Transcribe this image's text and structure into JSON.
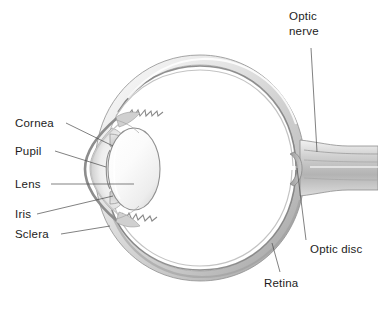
{
  "figure": {
    "background_color": "#ffffff",
    "text_color": "#1c1c1c",
    "leader_line_color": "#4a4a4a"
  },
  "labels": {
    "cornea": "Cornea",
    "pupil": "Pupil",
    "lens": "Lens",
    "iris": "Iris",
    "sclera": "Sclera",
    "optic_nerve_line1": "Optic",
    "optic_nerve_line2": "nerve",
    "optic_disc": "Optic disc",
    "retina": "Retina"
  },
  "structures": [
    {
      "name": "sclera",
      "description": "outer white fibrous coat of the eyeball"
    },
    {
      "name": "choroid-retina",
      "description": "dark inner lining layers of the globe wall"
    },
    {
      "name": "cornea",
      "description": "transparent bulging front dome"
    },
    {
      "name": "anterior-chamber",
      "description": "shaded space between cornea and lens"
    },
    {
      "name": "lens",
      "description": "central biconvex ellipse"
    },
    {
      "name": "iris",
      "description": "wedges above and below the lens"
    },
    {
      "name": "pupil",
      "description": "central aperture of the iris"
    },
    {
      "name": "ciliary-body",
      "description": "jagged ora serrata band inside the wall"
    },
    {
      "name": "vitreous-body",
      "description": "large white interior chamber"
    },
    {
      "name": "optic-disc",
      "description": "junction where nerve fibres leave the retina"
    },
    {
      "name": "optic-nerve",
      "description": "tapered trunk leaving the globe to the right"
    }
  ],
  "colors": {
    "sclera_light": "#f4f4f4",
    "sclera_mid": "#d9d9d9",
    "sclera_shadow": "#a8a8a8",
    "wall_line": "#8c8c8c",
    "wall_dark": "#6e6e6e",
    "lens_fill": "#fafafa",
    "lens_edge": "#9a9a9a",
    "vitreous": "#ffffff"
  }
}
